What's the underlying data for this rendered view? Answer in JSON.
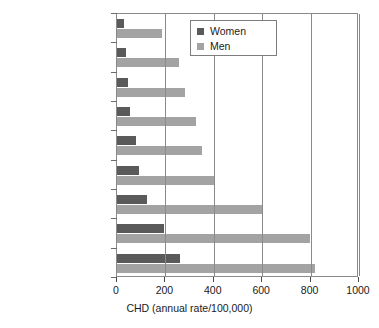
{
  "chart_data": {
    "type": "bar",
    "orientation": "horizontal",
    "title": "",
    "xlabel": "CHD (annual rate/100,000)",
    "ylabel": "",
    "xlim": [
      0,
      1000
    ],
    "xticks": [
      0,
      200,
      400,
      600,
      800,
      1000
    ],
    "xtick_labels": [
      "0",
      "200",
      "400",
      "600",
      "800",
      "1000"
    ],
    "grid": "vertical",
    "legend_position": "upper-center",
    "categories": [
      "Spain (Catalonia)",
      "France (Toulouse)",
      "Italy (Frioul)",
      "France (Lille)",
      "France (Strasbourg)",
      "Germany (Bremen)",
      "Sweden (North)",
      "UK N. Ireland",
      "UK Glasgow"
    ],
    "series": [
      {
        "name": "Women",
        "color": "#5a5a5a",
        "values": [
          27,
          37,
          44,
          55,
          80,
          92,
          124,
          193,
          262
        ]
      },
      {
        "name": "Men",
        "color": "#a3a3a3",
        "values": [
          186,
          255,
          283,
          328,
          352,
          400,
          600,
          796,
          817
        ]
      }
    ]
  }
}
